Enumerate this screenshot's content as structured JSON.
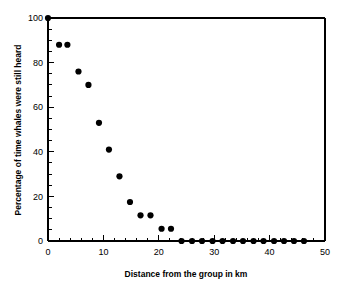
{
  "chart_data": {
    "type": "scatter",
    "title": "",
    "xlabel": "Distance from the group in km",
    "ylabel": "Percentage of time whales were still heard",
    "xlim": [
      0,
      50
    ],
    "ylim": [
      0,
      100
    ],
    "xticks": [
      0,
      10,
      20,
      30,
      40,
      50
    ],
    "xtick_labels": [
      "0",
      "10",
      "20",
      "30",
      "40",
      "50"
    ],
    "x_minor_interval": 2,
    "yticks": [
      0,
      20,
      40,
      60,
      80,
      100
    ],
    "ytick_labels": [
      "0",
      "20",
      "40",
      "60",
      "80",
      "100"
    ],
    "y_minor_interval": 5,
    "grid": false,
    "legend": false,
    "marker": "filled-circle",
    "marker_color": "#000000",
    "series": [
      {
        "name": "Percentage of time whales were still heard",
        "points": [
          {
            "x": 0.0,
            "y": 100.0
          },
          {
            "x": 2.0,
            "y": 88.0
          },
          {
            "x": 3.5,
            "y": 88.0
          },
          {
            "x": 5.5,
            "y": 76.0
          },
          {
            "x": 7.3,
            "y": 70.0
          },
          {
            "x": 9.2,
            "y": 53.0
          },
          {
            "x": 11.0,
            "y": 41.0
          },
          {
            "x": 12.9,
            "y": 29.0
          },
          {
            "x": 14.8,
            "y": 17.5
          },
          {
            "x": 16.7,
            "y": 11.5
          },
          {
            "x": 18.5,
            "y": 11.5
          },
          {
            "x": 20.5,
            "y": 5.5
          },
          {
            "x": 22.2,
            "y": 5.5
          },
          {
            "x": 24.1,
            "y": 0.0
          },
          {
            "x": 26.0,
            "y": 0.0
          },
          {
            "x": 27.8,
            "y": 0.0
          },
          {
            "x": 29.7,
            "y": 0.0
          },
          {
            "x": 31.5,
            "y": 0.0
          },
          {
            "x": 33.4,
            "y": 0.0
          },
          {
            "x": 35.2,
            "y": 0.0
          },
          {
            "x": 37.1,
            "y": 0.0
          },
          {
            "x": 38.9,
            "y": 0.0
          },
          {
            "x": 40.8,
            "y": 0.0
          },
          {
            "x": 42.6,
            "y": 0.0
          },
          {
            "x": 44.4,
            "y": 0.0
          },
          {
            "x": 46.2,
            "y": 0.0
          }
        ]
      }
    ]
  }
}
